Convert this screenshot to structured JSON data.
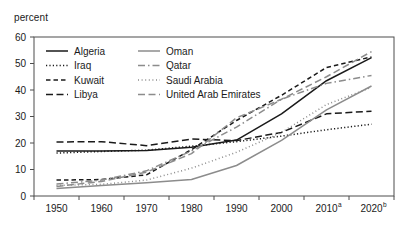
{
  "chart_data": {
    "type": "line",
    "title": "",
    "subtitle": "",
    "ylabel": "percent",
    "xlabel": "",
    "ylim": [
      0,
      60
    ],
    "ytick_values": [
      0,
      10,
      20,
      30,
      40,
      50,
      60
    ],
    "ytick_labels": [
      "0",
      "10",
      "20",
      "30",
      "40",
      "50",
      "60"
    ],
    "grid": false,
    "legend_position": "top-left-inside",
    "x": [
      1950,
      1960,
      1970,
      1980,
      1990,
      2000,
      2010,
      2020
    ],
    "xtick_labels": [
      "1950",
      "1960",
      "1970",
      "1980",
      "1990",
      "2000",
      "2010",
      "2020"
    ],
    "xtick_superscripts": [
      "",
      "",
      "",
      "",
      "",
      "",
      "a",
      "b"
    ],
    "series": [
      {
        "name": "Algeria",
        "style": "solid",
        "color": "#1a1a1a",
        "values": [
          17.0,
          17.0,
          17.2,
          18.4,
          21.1,
          31.0,
          43.5,
          52.2
        ]
      },
      {
        "name": "Iraq",
        "style": "dotted",
        "color": "#1a1a1a",
        "values": [
          16.2,
          16.8,
          17.3,
          18.8,
          20.5,
          22.6,
          25.0,
          27.1
        ]
      },
      {
        "name": "Kuwait",
        "style": "dashed",
        "color": "#1a1a1a",
        "values": [
          6.0,
          6.2,
          8.0,
          17.5,
          28.5,
          38.0,
          48.5,
          52.5
        ]
      },
      {
        "name": "Libya",
        "style": "long-dash",
        "color": "#1a1a1a",
        "values": [
          20.4,
          20.5,
          19.0,
          21.5,
          20.9,
          24.0,
          31.0,
          32.0
        ]
      },
      {
        "name": "Oman",
        "style": "solid",
        "color": "#8c8c8c",
        "values": [
          2.8,
          4.0,
          5.0,
          6.2,
          11.5,
          21.0,
          32.5,
          41.5
        ]
      },
      {
        "name": "Qatar",
        "style": "dash-dot",
        "color": "#8c8c8c",
        "values": [
          4.5,
          6.0,
          9.5,
          17.0,
          26.0,
          36.5,
          42.5,
          45.5
        ]
      },
      {
        "name": "Saudi Arabia",
        "style": "fine-dotted",
        "color": "#8c8c8c",
        "values": [
          4.0,
          4.4,
          6.0,
          10.5,
          16.5,
          24.0,
          34.5,
          41.0
        ]
      },
      {
        "name": "United Arab Emirates",
        "style": "long-dash",
        "color": "#8c8c8c",
        "values": [
          3.6,
          5.5,
          9.0,
          16.0,
          29.5,
          36.5,
          45.0,
          54.5
        ]
      }
    ],
    "legend": [
      {
        "label": "Algeria",
        "style": "solid",
        "color": "#1a1a1a"
      },
      {
        "label": "Iraq",
        "style": "dotted",
        "color": "#1a1a1a"
      },
      {
        "label": "Kuwait",
        "style": "dashed",
        "color": "#1a1a1a"
      },
      {
        "label": "Libya",
        "style": "long-dash",
        "color": "#1a1a1a"
      },
      {
        "label": "Oman",
        "style": "solid",
        "color": "#8c8c8c"
      },
      {
        "label": "Qatar",
        "style": "dash-dot",
        "color": "#8c8c8c"
      },
      {
        "label": "Saudi Arabia",
        "style": "fine-dotted",
        "color": "#8c8c8c"
      },
      {
        "label": "United Arab Emirates",
        "style": "long-dash",
        "color": "#8c8c8c"
      }
    ]
  },
  "colors": {
    "primary_series": "#1a1a1a",
    "secondary_series": "#8c8c8c",
    "axis": "#4d4d4d",
    "background": "#ffffff"
  }
}
